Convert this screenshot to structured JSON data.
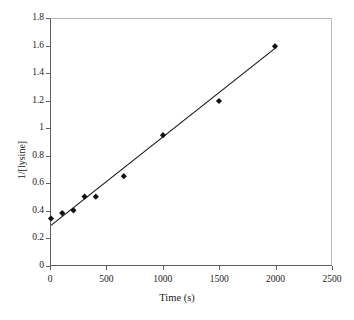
{
  "chart_data": {
    "type": "scatter",
    "title": "",
    "xlabel": "Time (s)",
    "ylabel": "1/[lysine]",
    "xlim": [
      0,
      2500
    ],
    "ylim": [
      0,
      1.8
    ],
    "grid": false,
    "legend": "none",
    "xticks": [
      "0",
      "500",
      "1000",
      "1500",
      "2000",
      "2500"
    ],
    "xtick_values": [
      0,
      500,
      1000,
      1500,
      2000,
      2500
    ],
    "yticks": [
      "0",
      "0.2",
      "0.4",
      "0.6",
      "0.8",
      "1",
      "1.2",
      "1.4",
      "1.6",
      "1.8"
    ],
    "ytick_values": [
      0,
      0.2,
      0.4,
      0.6,
      0.8,
      1,
      1.2,
      1.4,
      1.6,
      1.8
    ],
    "series": [
      {
        "name": "1/[lysine] data",
        "marker": "filled-diamond",
        "color": "#111111",
        "x": [
          0,
          100,
          200,
          300,
          400,
          650,
          1000,
          1500,
          2000
        ],
        "y": [
          0.34,
          0.38,
          0.4,
          0.5,
          0.5,
          0.65,
          0.95,
          1.2,
          1.6
        ]
      }
    ],
    "fit_line": {
      "name": "linear-fit",
      "color": "#111111",
      "x": [
        0,
        2000
      ],
      "y": [
        0.29,
        1.585
      ],
      "slope": 0.0006475,
      "intercept": 0.29
    }
  },
  "axes": {
    "x_title": "Time (s)",
    "y_title": "1/[lysine]"
  }
}
